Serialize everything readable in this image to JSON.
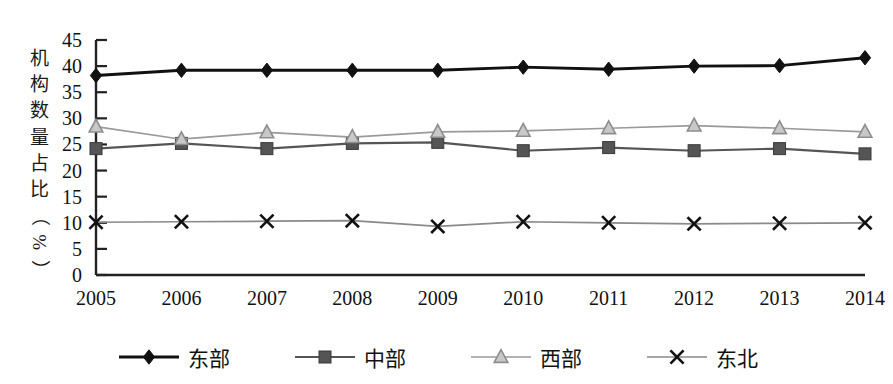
{
  "chart_data": {
    "type": "line",
    "title": "",
    "subtitle": "",
    "xlabel": "",
    "ylabel": "机构数量占比（%）",
    "ylim": [
      0,
      45
    ],
    "ytick_step": 5,
    "grid": false,
    "legend_position": "bottom",
    "categories": [
      "2005",
      "2006",
      "2007",
      "2008",
      "2009",
      "2010",
      "2011",
      "2012",
      "2013",
      "2014"
    ],
    "yticks": [
      "0",
      "5",
      "10",
      "15",
      "20",
      "25",
      "30",
      "35",
      "40",
      "45"
    ],
    "series": [
      {
        "name": "东部",
        "marker": "diamond",
        "color": "#111111",
        "values": [
          38.2,
          39.2,
          39.2,
          39.2,
          39.2,
          39.8,
          39.4,
          40.0,
          40.1,
          41.6
        ]
      },
      {
        "name": "中部",
        "marker": "square",
        "color": "#555555",
        "values": [
          24.2,
          25.2,
          24.2,
          25.2,
          25.4,
          23.8,
          24.4,
          23.8,
          24.2,
          23.2
        ]
      },
      {
        "name": "西部",
        "marker": "triangle",
        "color": "#9a9a9a",
        "values": [
          28.4,
          26.0,
          27.3,
          26.4,
          27.4,
          27.6,
          28.1,
          28.6,
          28.1,
          27.4
        ]
      },
      {
        "name": "东北",
        "marker": "x",
        "color": "#8a8a8a",
        "values": [
          10.1,
          10.2,
          10.3,
          10.4,
          9.3,
          10.2,
          10.0,
          9.8,
          9.9,
          10.0
        ]
      }
    ]
  },
  "axis": {
    "y_title_chars": [
      "机",
      "构",
      "数",
      "量",
      "占",
      "比",
      "（",
      "%",
      "）"
    ]
  },
  "legend": {
    "items": [
      {
        "label": "东部",
        "marker": "diamond",
        "color": "#111111"
      },
      {
        "label": "中部",
        "marker": "square",
        "color": "#555555"
      },
      {
        "label": "西部",
        "marker": "triangle",
        "color": "#9a9a9a"
      },
      {
        "label": "东北",
        "marker": "x",
        "color": "#8a8a8a"
      }
    ]
  }
}
